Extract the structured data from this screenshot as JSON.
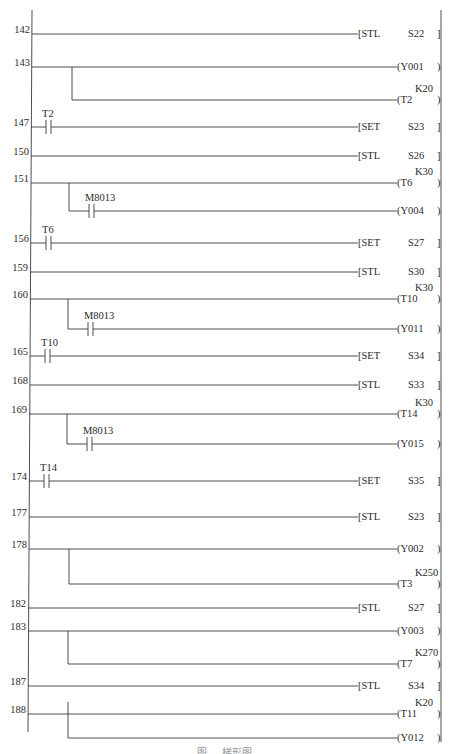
{
  "diagram": {
    "type": "PLC ladder diagram",
    "caption": "图 … 梯形图",
    "rungs": [
      {
        "step": "142",
        "kind": "stl",
        "instr": "STL",
        "operand": "S22"
      },
      {
        "step": "143",
        "kind": "outputs",
        "outputs": [
          {
            "coil": "Y001",
            "preset": ""
          },
          {
            "coil": "T2",
            "preset": "K20"
          }
        ]
      },
      {
        "step": "147",
        "kind": "contact-set",
        "contact": "T2",
        "instr": "SET",
        "operand": "S23"
      },
      {
        "step": "150",
        "kind": "stl",
        "instr": "STL",
        "operand": "S26"
      },
      {
        "step": "151",
        "kind": "outputs-contact",
        "outputs": [
          {
            "coil": "T6",
            "preset": "K30"
          },
          {
            "coil": "Y004",
            "preset": "",
            "contact": "M8013"
          }
        ]
      },
      {
        "step": "156",
        "kind": "contact-set",
        "contact": "T6",
        "instr": "SET",
        "operand": "S27"
      },
      {
        "step": "159",
        "kind": "stl",
        "instr": "STL",
        "operand": "S30"
      },
      {
        "step": "160",
        "kind": "outputs-contact",
        "outputs": [
          {
            "coil": "T10",
            "preset": "K30"
          },
          {
            "coil": "Y011",
            "preset": "",
            "contact": "M8013"
          }
        ]
      },
      {
        "step": "165",
        "kind": "contact-set",
        "contact": "T10",
        "instr": "SET",
        "operand": "S34"
      },
      {
        "step": "168",
        "kind": "stl",
        "instr": "STL",
        "operand": "S33"
      },
      {
        "step": "169",
        "kind": "outputs-contact",
        "outputs": [
          {
            "coil": "T14",
            "preset": "K30"
          },
          {
            "coil": "Y015",
            "preset": "",
            "contact": "M8013"
          }
        ]
      },
      {
        "step": "174",
        "kind": "contact-set",
        "contact": "T14",
        "instr": "SET",
        "operand": "S35"
      },
      {
        "step": "177",
        "kind": "stl",
        "instr": "STL",
        "operand": "S23"
      },
      {
        "step": "178",
        "kind": "outputs",
        "outputs": [
          {
            "coil": "Y002",
            "preset": ""
          },
          {
            "coil": "T3",
            "preset": "K250"
          }
        ]
      },
      {
        "step": "182",
        "kind": "stl",
        "instr": "STL",
        "operand": "S27"
      },
      {
        "step": "183",
        "kind": "outputs",
        "outputs": [
          {
            "coil": "Y003",
            "preset": ""
          },
          {
            "coil": "T7",
            "preset": "K270"
          }
        ]
      },
      {
        "step": "187",
        "kind": "stl",
        "instr": "STL",
        "operand": "S34"
      },
      {
        "step": "188",
        "kind": "outputs",
        "outputs": [
          {
            "coil": "T11",
            "preset": "K20"
          },
          {
            "coil": "Y012",
            "preset": ""
          }
        ]
      }
    ]
  }
}
